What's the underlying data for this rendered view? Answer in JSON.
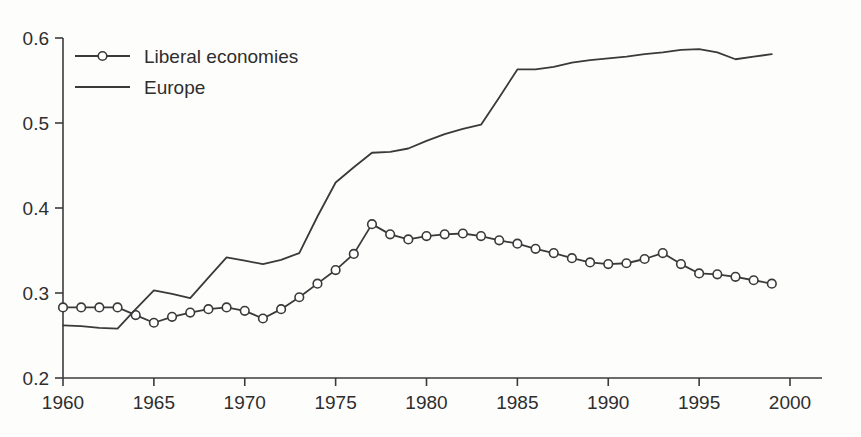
{
  "chart_data": {
    "type": "line",
    "title": "",
    "subtitle": "",
    "xlabel": "",
    "ylabel": "",
    "xlim": [
      1960,
      2000
    ],
    "ylim": [
      0.2,
      0.6
    ],
    "grid": false,
    "legend_position": "top-left",
    "x_ticks": [
      "1960",
      "1965",
      "1970",
      "1975",
      "1980",
      "1985",
      "1990",
      "1995",
      "2000"
    ],
    "x_tick_values": [
      1960,
      1965,
      1970,
      1975,
      1980,
      1985,
      1990,
      1995,
      2000
    ],
    "y_ticks": [
      "0.2",
      "0.3",
      "0.4",
      "0.5",
      "0.6"
    ],
    "y_tick_values": [
      0.2,
      0.3,
      0.4,
      0.5,
      0.6
    ],
    "x": [
      1960,
      1961,
      1962,
      1963,
      1964,
      1965,
      1966,
      1967,
      1968,
      1969,
      1970,
      1971,
      1972,
      1973,
      1974,
      1975,
      1976,
      1977,
      1978,
      1979,
      1980,
      1981,
      1982,
      1983,
      1984,
      1985,
      1986,
      1987,
      1988,
      1989,
      1990,
      1991,
      1992,
      1993,
      1994,
      1995,
      1996,
      1997,
      1998,
      1999
    ],
    "series": [
      {
        "name": "Liberal economies",
        "marker": "circle-open",
        "values": [
          0.283,
          0.283,
          0.283,
          0.283,
          0.274,
          0.265,
          0.272,
          0.277,
          0.281,
          0.283,
          0.279,
          0.27,
          0.281,
          0.295,
          0.311,
          0.327,
          0.346,
          0.381,
          0.369,
          0.363,
          0.367,
          0.369,
          0.37,
          0.367,
          0.362,
          0.358,
          0.352,
          0.347,
          0.341,
          0.336,
          0.334,
          0.335,
          0.34,
          0.347,
          0.334,
          0.323,
          0.322,
          0.319,
          0.315,
          0.311
        ]
      },
      {
        "name": "Europe",
        "marker": "none",
        "values": [
          0.262,
          0.261,
          0.259,
          0.258,
          0.281,
          0.303,
          0.299,
          0.294,
          0.318,
          0.342,
          0.338,
          0.334,
          0.339,
          0.347,
          0.39,
          0.43,
          0.448,
          0.465,
          0.466,
          0.47,
          0.479,
          0.487,
          0.493,
          0.498,
          0.53,
          0.563,
          0.563,
          0.566,
          0.571,
          0.574,
          0.576,
          0.578,
          0.581,
          0.583,
          0.586,
          0.587,
          0.583,
          0.575,
          0.578,
          0.581
        ]
      }
    ]
  },
  "legend": {
    "entries": [
      {
        "label": "Liberal economies"
      },
      {
        "label": "Europe"
      }
    ]
  }
}
